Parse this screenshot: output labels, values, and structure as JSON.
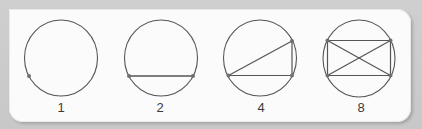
{
  "diagram": {
    "title": "",
    "colors": {
      "stroke": "#555555",
      "point": "#6f6f6f",
      "label": "#3a3a3a",
      "card": "#fbfbfb",
      "frame": "#c9c9c9"
    },
    "figures": [
      {
        "id": "fig-1",
        "label": "1",
        "points": 1,
        "chords": 0,
        "regions": 1
      },
      {
        "id": "fig-2",
        "label": "2",
        "points": 2,
        "chords": 1,
        "regions": 2
      },
      {
        "id": "fig-4",
        "label": "4",
        "points": 3,
        "chords": 3,
        "regions": 4
      },
      {
        "id": "fig-8",
        "label": "8",
        "points": 4,
        "chords": 6,
        "regions": 8
      }
    ]
  }
}
